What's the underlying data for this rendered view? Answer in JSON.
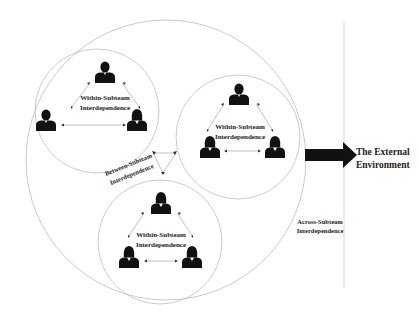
{
  "diagram": {
    "subteams": [
      {
        "id": "subteam-top-left",
        "label_line1": "Within-Subteam",
        "label_line2": "Interdependence",
        "members": [
          "male",
          "male",
          "female"
        ]
      },
      {
        "id": "subteam-right",
        "label_line1": "Within-Subteam",
        "label_line2": "Interdependence",
        "members": [
          "male",
          "female",
          "female"
        ]
      },
      {
        "id": "subteam-bottom",
        "label_line1": "Within-Subteam",
        "label_line2": "Interdependence",
        "members": [
          "female",
          "female",
          "female"
        ]
      }
    ],
    "between_label_line1": "Between-Subteam",
    "between_label_line2": "Interdependence",
    "across_label_line1": "Across-Subteam",
    "across_label_line2": "Interdependence",
    "external_label_line1": "The External",
    "external_label_line2": "Environment",
    "colors": {
      "circle_stroke": "#bdbdbd",
      "person_fill": "#111111",
      "arrow_fill": "#111111",
      "text": "#222222"
    }
  }
}
